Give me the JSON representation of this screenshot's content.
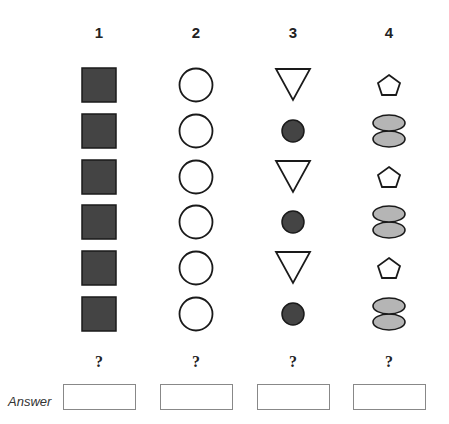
{
  "columns": [
    {
      "label": "1",
      "shapes": [
        "filled-square",
        "filled-square",
        "filled-square",
        "filled-square",
        "filled-square",
        "filled-square"
      ],
      "next": "?"
    },
    {
      "label": "2",
      "shapes": [
        "circle",
        "circle",
        "circle",
        "circle",
        "circle",
        "circle"
      ],
      "next": "?"
    },
    {
      "label": "3",
      "shapes": [
        "triangle-down",
        "filled-circle",
        "triangle-down",
        "filled-circle",
        "triangle-down",
        "filled-circle"
      ],
      "next": "?"
    },
    {
      "label": "4",
      "shapes": [
        "pentagon",
        "double-ellipse",
        "pentagon",
        "double-ellipse",
        "pentagon",
        "double-ellipse"
      ],
      "next": "?"
    }
  ],
  "answer": {
    "label": "Answer",
    "values": [
      "",
      "",
      "",
      ""
    ]
  },
  "colors": {
    "dark_fill": "#444444",
    "light_fill": "#b5b5b5",
    "stroke": "#1a1a1a"
  }
}
